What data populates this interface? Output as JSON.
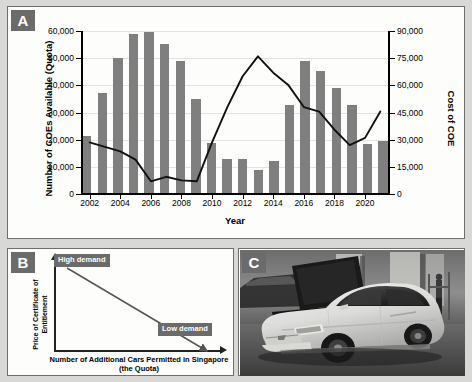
{
  "figure": {
    "panel_a_tag": "A",
    "panel_b_tag": "B",
    "panel_c_tag": "C",
    "bottom_caption": ""
  },
  "chart_data": [
    {
      "type": "bar",
      "id": "panel-a",
      "title": "",
      "xlabel": "Year",
      "ylabel": "Number of COEs Available (Quota)",
      "y2label": "Cost of COE",
      "grid": true,
      "legend": "none",
      "ylim": [
        0,
        60000
      ],
      "y2lim": [
        0,
        90000
      ],
      "yticks": [
        "0",
        "10,000",
        "20,000",
        "30,000",
        "40,000",
        "50,000",
        "60,000"
      ],
      "ytick_values": [
        0,
        10000,
        20000,
        30000,
        40000,
        50000,
        60000
      ],
      "y2ticks": [
        "0",
        "15,000",
        "30,000",
        "45,000",
        "60,000",
        "75,000",
        "90,000"
      ],
      "y2tick_values": [
        0,
        15000,
        30000,
        45000,
        60000,
        75000,
        90000
      ],
      "categories": [
        2002,
        2003,
        2004,
        2005,
        2006,
        2007,
        2008,
        2009,
        2010,
        2011,
        2012,
        2013,
        2014,
        2015,
        2016,
        2017,
        2018,
        2019,
        2020,
        2021
      ],
      "xtick_labels": [
        "2002",
        "2004",
        "2006",
        "2008",
        "2010",
        "2012",
        "2014",
        "2016",
        "2018",
        "2020"
      ],
      "xtick_years": [
        2002,
        2004,
        2006,
        2008,
        2010,
        2012,
        2014,
        2016,
        2018,
        2020
      ],
      "series": [
        {
          "name": "Number of COEs Available (Quota)",
          "type": "bar",
          "axis": "left",
          "color": "#7f7f7f",
          "values": [
            21200,
            37300,
            50100,
            58800,
            59800,
            55400,
            48900,
            34800,
            18700,
            12900,
            12900,
            8800,
            12300,
            32900,
            48900,
            45400,
            38900,
            32800,
            18400,
            19500
          ]
        },
        {
          "name": "Cost of COE",
          "type": "line",
          "axis": "right",
          "color": "#111111",
          "values": [
            28500,
            26000,
            23500,
            19000,
            7000,
            9500,
            7500,
            7000,
            28500,
            48000,
            65000,
            76000,
            67000,
            60000,
            48000,
            45500,
            35500,
            27000,
            31000,
            45500
          ]
        }
      ]
    },
    {
      "type": "line",
      "id": "panel-b",
      "title": "",
      "xlabel": "Number of Additional Cars Permitted in Singapore (the Quota)",
      "ylabel": "Price of Certificate of Entitlement",
      "annotations": [
        {
          "text": "High demand",
          "position": "top-left"
        },
        {
          "text": "Low demand",
          "position": "bottom-right"
        }
      ],
      "series": [
        {
          "name": "Demand curve",
          "x": [
            0,
            100
          ],
          "y": [
            100,
            0
          ],
          "color": "#555555"
        }
      ]
    }
  ]
}
